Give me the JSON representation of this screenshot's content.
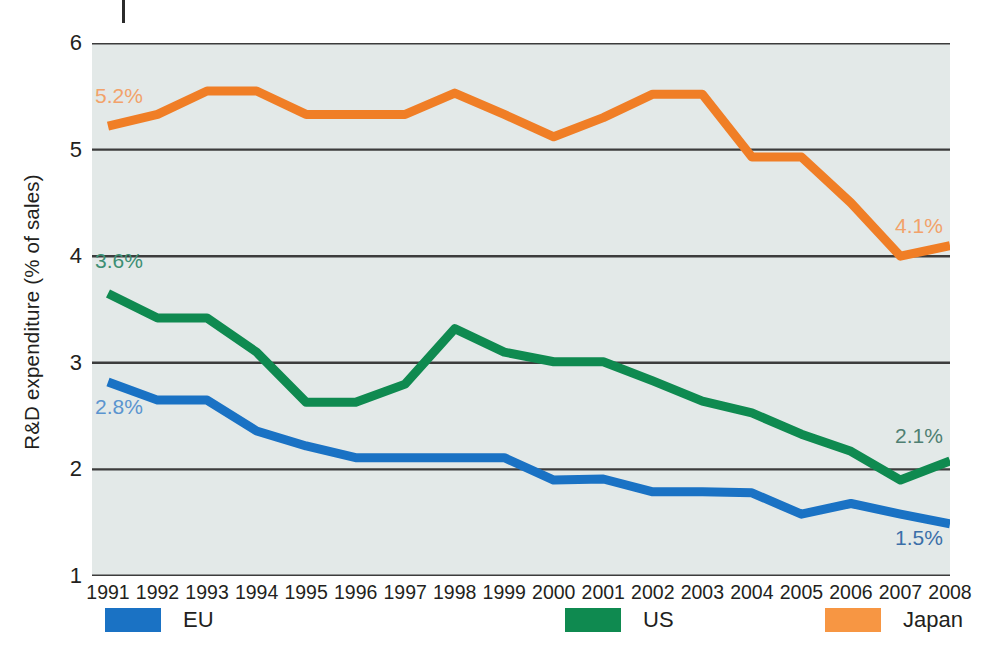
{
  "chart_data": {
    "type": "line",
    "title": "",
    "xlabel": "",
    "ylabel": "R&D expenditure (% of sales)",
    "x": [
      1991,
      1992,
      1993,
      1994,
      1995,
      1996,
      1997,
      1998,
      1999,
      2000,
      2001,
      2002,
      2003,
      2004,
      2005,
      2006,
      2007,
      2008
    ],
    "categories": [
      "1991",
      "1992",
      "1993",
      "1994",
      "1995",
      "1996",
      "1997",
      "1998",
      "1999",
      "2000",
      "2001",
      "2002",
      "2003",
      "2004",
      "2005",
      "2006",
      "2007",
      "2008"
    ],
    "ylim": [
      1,
      6
    ],
    "yticks": [
      "1",
      "2",
      "3",
      "4",
      "5",
      "6"
    ],
    "grid": true,
    "legend_position": "bottom",
    "series": [
      {
        "name": "EU",
        "color": "#1a72c4",
        "values": [
          2.82,
          2.65,
          2.65,
          2.36,
          2.22,
          2.11,
          2.11,
          2.11,
          2.11,
          1.9,
          1.91,
          1.79,
          1.79,
          1.78,
          1.58,
          1.68,
          1.58,
          1.49
        ],
        "start_label": "2.8%",
        "end_label": "1.5%"
      },
      {
        "name": "US",
        "color": "#0f8a50",
        "values": [
          3.65,
          3.42,
          3.42,
          3.1,
          2.63,
          2.63,
          2.8,
          3.32,
          3.1,
          3.01,
          3.01,
          2.83,
          2.64,
          2.53,
          2.33,
          2.17,
          1.9,
          2.08
        ],
        "start_label": "3.6%",
        "end_label": "2.1%"
      },
      {
        "name": "Japan",
        "color": "#f07e26",
        "values": [
          5.22,
          5.33,
          5.55,
          5.55,
          5.33,
          5.33,
          5.33,
          5.53,
          5.33,
          5.12,
          5.3,
          5.52,
          5.52,
          4.93,
          4.93,
          4.5,
          4.0,
          4.1
        ],
        "start_label": "5.2%",
        "end_label": "4.1%"
      }
    ]
  },
  "axis": {
    "y_title": "R&D expenditure (% of sales)",
    "y_ticks": [
      "6",
      "5",
      "4",
      "3",
      "2",
      "1"
    ],
    "x_ticks": [
      "1991",
      "1992",
      "1993",
      "1994",
      "1995",
      "1996",
      "1997",
      "1998",
      "1999",
      "2000",
      "2001",
      "2002",
      "2003",
      "2004",
      "2005",
      "2006",
      "2007",
      "2008"
    ]
  },
  "annotations": [
    {
      "text": "5.2%",
      "color": "#f2a26a"
    },
    {
      "text": "3.6%",
      "color": "#3d8f74"
    },
    {
      "text": "2.8%",
      "color": "#5a94cf"
    },
    {
      "text": "4.1%",
      "color": "#f2a26a"
    },
    {
      "text": "2.1%",
      "color": "#4f7f72"
    },
    {
      "text": "1.5%",
      "color": "#3b6fa8"
    }
  ],
  "legend": {
    "items": [
      {
        "label": "EU",
        "color": "#1a72c4"
      },
      {
        "label": "US",
        "color": "#0f8a50"
      },
      {
        "label": "Japan",
        "color": "#f79643"
      }
    ]
  },
  "style": {
    "plot_background": "#e3e9e8",
    "gridline_color": "#3c3c3c",
    "page_background": "#ffffff"
  }
}
